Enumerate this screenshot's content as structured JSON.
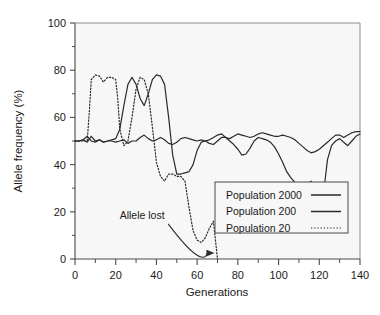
{
  "chart_data": {
    "type": "line",
    "title": "",
    "xlabel": "Generations",
    "ylabel": "Allele frequency (%)",
    "xlim": [
      0,
      140
    ],
    "ylim": [
      0,
      100
    ],
    "xticks": [
      0,
      20,
      40,
      60,
      80,
      100,
      120,
      140
    ],
    "yticks": [
      0,
      20,
      40,
      60,
      80,
      100
    ],
    "xtick_labels": [
      "0",
      "20",
      "40",
      "60",
      "80",
      "100",
      "120",
      "140"
    ],
    "ytick_labels": [
      "0",
      "20",
      "40",
      "60",
      "80",
      "100"
    ],
    "minor_xticks": [
      10,
      30,
      50,
      70,
      90,
      110,
      130
    ],
    "minor_yticks": [
      10,
      30,
      50,
      70,
      90
    ],
    "grid": false,
    "legend_position": "lower-right",
    "plot_background": "#f7f7f7",
    "line_color": "#2b2b2b",
    "series": [
      {
        "name": "Population 2000",
        "style": "solid",
        "width": 1.2,
        "x": [
          0,
          2,
          4,
          6,
          8,
          10,
          12,
          14,
          16,
          18,
          20,
          22,
          24,
          26,
          28,
          30,
          32,
          34,
          36,
          38,
          40,
          42,
          44,
          46,
          48,
          50,
          52,
          54,
          56,
          58,
          60,
          62,
          64,
          66,
          68,
          70,
          72,
          74,
          76,
          78,
          80,
          82,
          84,
          86,
          88,
          90,
          92,
          94,
          96,
          98,
          100,
          102,
          104,
          106,
          108,
          110,
          112,
          114,
          116,
          118,
          120,
          122,
          124,
          126,
          128,
          130,
          132,
          134,
          136,
          138,
          140
        ],
        "y": [
          50,
          50,
          50.5,
          49.5,
          52,
          50,
          50.5,
          49.5,
          50,
          50,
          49.5,
          50,
          50.5,
          49,
          50,
          50,
          51.5,
          52.5,
          51,
          50,
          50.5,
          51.5,
          50.5,
          49,
          48.5,
          49.5,
          51,
          51.5,
          51,
          50.5,
          50,
          50.5,
          50,
          49,
          48.5,
          50,
          51.5,
          51.5,
          51,
          52,
          53,
          52.5,
          52,
          51.5,
          52,
          53,
          53.5,
          53,
          52.5,
          52,
          52,
          52.5,
          52,
          51.5,
          50.5,
          49,
          47.5,
          46,
          45,
          45.5,
          46.5,
          48,
          49.5,
          51,
          52.5,
          52.5,
          51.5,
          52.5,
          53.5,
          54,
          54
        ]
      },
      {
        "name": "Population 200",
        "style": "solid",
        "width": 1.2,
        "x": [
          0,
          2,
          4,
          6,
          8,
          10,
          12,
          14,
          16,
          18,
          20,
          22,
          24,
          26,
          28,
          30,
          32,
          34,
          36,
          38,
          40,
          42,
          44,
          46,
          48,
          50,
          52,
          54,
          56,
          58,
          60,
          62,
          64,
          66,
          68,
          70,
          72,
          74,
          76,
          78,
          80,
          82,
          84,
          86,
          88,
          90,
          92,
          94,
          96,
          98,
          100,
          102,
          104,
          106,
          108,
          110,
          112,
          114,
          116,
          118,
          120,
          122,
          124,
          126,
          128,
          130,
          132,
          134,
          136,
          138,
          140
        ],
        "y": [
          50,
          50,
          50.5,
          52,
          50,
          49.5,
          50.5,
          49.5,
          50,
          50.5,
          51,
          55,
          65,
          74,
          77,
          74,
          68,
          65,
          70,
          76,
          78,
          77.5,
          74,
          60,
          44,
          36,
          36,
          36.5,
          37,
          40,
          46,
          49.5,
          50,
          50.5,
          51.5,
          52.5,
          53,
          51.5,
          50,
          48.5,
          46.5,
          44,
          44.5,
          47,
          50,
          51.5,
          51,
          50.5,
          49.5,
          47.5,
          44.5,
          41,
          37,
          34.5,
          32.5,
          31.5,
          31,
          31.5,
          33,
          23,
          12,
          27,
          42,
          48,
          50,
          51,
          49.5,
          48,
          50,
          52,
          53
        ]
      },
      {
        "name": "Population 20",
        "style": "dotted",
        "width": 1.2,
        "x": [
          0,
          2,
          4,
          6,
          7,
          8,
          10,
          12,
          14,
          16,
          18,
          20,
          21,
          22,
          24,
          26,
          28,
          30,
          32,
          34,
          36,
          38,
          40,
          42,
          44,
          46,
          48,
          50,
          52,
          54,
          56,
          58,
          60,
          62,
          64,
          66,
          68,
          70
        ],
        "y": [
          50,
          50,
          50,
          50,
          62,
          76,
          78,
          77.5,
          75,
          77,
          77,
          76,
          68,
          55,
          48,
          50,
          60,
          72,
          77,
          76,
          70,
          56,
          41,
          35,
          33,
          36,
          36,
          35,
          35,
          33,
          22,
          12,
          8,
          7,
          9,
          13,
          16,
          0
        ]
      }
    ],
    "annotations": [
      {
        "text": "Allele lost",
        "x": 33,
        "y": 17
      }
    ]
  },
  "legend": {
    "entries": [
      {
        "label": "Population 2000",
        "style": "solid"
      },
      {
        "label": "Population 200",
        "style": "solid"
      },
      {
        "label": "Population 20",
        "style": "dotted"
      }
    ]
  }
}
